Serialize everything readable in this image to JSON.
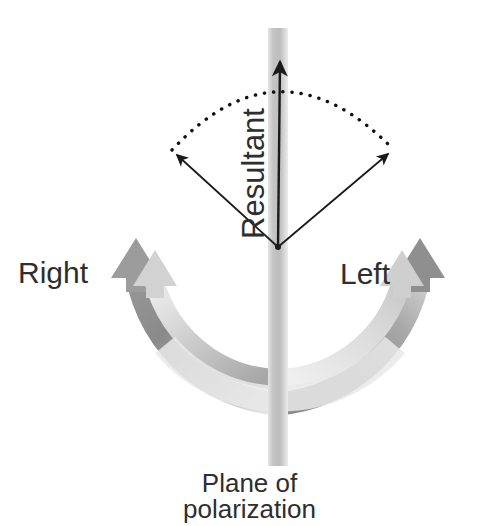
{
  "figure": {
    "background_color": "#ffffff",
    "labels": {
      "right": "Right",
      "left": "Left",
      "resultant": "Resultant",
      "plane_line1": "Plane of",
      "plane_line2": "polarization"
    },
    "colors": {
      "text": "#2e2e2e",
      "arc_dark": "#8a8a8a",
      "arc_mid": "#9e9e9e",
      "arc_light": "#d6d6d6",
      "arc_pale": "#e8e8e8",
      "band": "#c9c9c9",
      "band_light": "#dddddd",
      "vector": "#1a1a1a",
      "dotted": "#111111"
    },
    "geometry": {
      "center_x": 278,
      "center_y": 247,
      "outer_ring_radius": 155,
      "inner_ring_radius": 126,
      "ring_thickness": 22,
      "band_x": 268,
      "band_width": 20,
      "band_top": 28,
      "band_bottom": 466
    },
    "vectors": [
      {
        "name": "resultant",
        "from": [
          278,
          247
        ],
        "to": [
          280,
          58
        ],
        "label": "Resultant",
        "direction": "up"
      },
      {
        "name": "right-component",
        "from": [
          278,
          247
        ],
        "to": [
          175,
          153
        ],
        "label": "Right",
        "direction": "up-left"
      },
      {
        "name": "left-component",
        "from": [
          278,
          247
        ],
        "to": [
          390,
          152
        ],
        "label": "Left",
        "direction": "up-right"
      }
    ],
    "dotted_arc": {
      "from": [
        175,
        153
      ],
      "to": [
        390,
        152
      ],
      "apex": [
        280,
        62
      ],
      "style": "dotted"
    },
    "rotation_arrows": [
      {
        "name": "right-circular-arrow",
        "label": "Right",
        "sense": "counterclockwise",
        "arrowhead_at": [
          120,
          250
        ],
        "arrowhead_direction": "up"
      },
      {
        "name": "left-circular-arrow",
        "label": "Left",
        "sense": "clockwise",
        "arrowhead_at": [
          432,
          250
        ],
        "arrowhead_direction": "up"
      }
    ]
  }
}
